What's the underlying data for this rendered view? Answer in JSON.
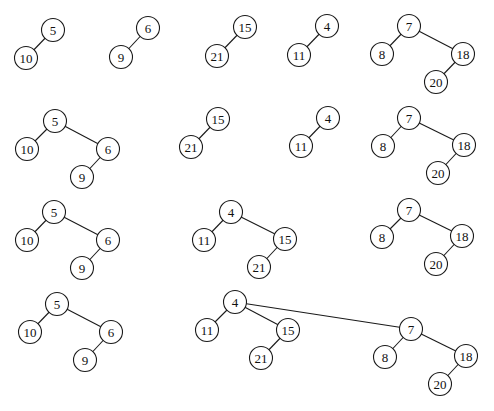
{
  "diagram": {
    "type": "binomial-heap-union-steps",
    "node_radius": 11.5,
    "colors": {
      "stroke": "#1a1a1a",
      "fill": "#ffffff",
      "text": "#111111",
      "background": "#ffffff"
    },
    "rows": [
      {
        "name": "row-1",
        "trees": [
          {
            "name": "tree-5",
            "nodes": [
              {
                "id": "a5",
                "label": "5",
                "x": 53,
                "y": 30
              },
              {
                "id": "a10",
                "label": "10",
                "x": 26,
                "y": 58
              }
            ],
            "edges": [
              [
                "a5",
                "a10"
              ]
            ]
          },
          {
            "name": "tree-6",
            "nodes": [
              {
                "id": "a6",
                "label": "6",
                "x": 148,
                "y": 28
              },
              {
                "id": "a9",
                "label": "9",
                "x": 121,
                "y": 57
              }
            ],
            "edges": [
              [
                "a6",
                "a9"
              ]
            ]
          },
          {
            "name": "tree-15",
            "nodes": [
              {
                "id": "a15",
                "label": "15",
                "x": 245,
                "y": 27
              },
              {
                "id": "a21",
                "label": "21",
                "x": 217,
                "y": 56
              }
            ],
            "edges": [
              [
                "a15",
                "a21"
              ]
            ]
          },
          {
            "name": "tree-4",
            "nodes": [
              {
                "id": "a4",
                "label": "4",
                "x": 327,
                "y": 26
              },
              {
                "id": "a11",
                "label": "11",
                "x": 299,
                "y": 55
              }
            ],
            "edges": [
              [
                "a4",
                "a11"
              ]
            ]
          },
          {
            "name": "tree-7",
            "nodes": [
              {
                "id": "a7",
                "label": "7",
                "x": 409,
                "y": 26
              },
              {
                "id": "a8",
                "label": "8",
                "x": 382,
                "y": 54
              },
              {
                "id": "a18",
                "label": "18",
                "x": 463,
                "y": 54
              },
              {
                "id": "a20",
                "label": "20",
                "x": 436,
                "y": 82
              }
            ],
            "edges": [
              [
                "a7",
                "a8"
              ],
              [
                "a7",
                "a18"
              ],
              [
                "a18",
                "a20"
              ]
            ]
          }
        ]
      },
      {
        "name": "row-2",
        "trees": [
          {
            "name": "tree-5",
            "nodes": [
              {
                "id": "b5",
                "label": "5",
                "x": 55,
                "y": 121
              },
              {
                "id": "b10",
                "label": "10",
                "x": 27,
                "y": 149
              },
              {
                "id": "b6",
                "label": "6",
                "x": 108,
                "y": 149
              },
              {
                "id": "b9",
                "label": "9",
                "x": 82,
                "y": 177
              }
            ],
            "edges": [
              [
                "b5",
                "b10"
              ],
              [
                "b5",
                "b6"
              ],
              [
                "b6",
                "b9"
              ]
            ]
          },
          {
            "name": "tree-15",
            "nodes": [
              {
                "id": "b15",
                "label": "15",
                "x": 218,
                "y": 119
              },
              {
                "id": "b21",
                "label": "21",
                "x": 191,
                "y": 147
              }
            ],
            "edges": [
              [
                "b15",
                "b21"
              ]
            ]
          },
          {
            "name": "tree-4",
            "nodes": [
              {
                "id": "b4",
                "label": "4",
                "x": 328,
                "y": 118
              },
              {
                "id": "b11",
                "label": "11",
                "x": 301,
                "y": 146
              }
            ],
            "edges": [
              [
                "b4",
                "b11"
              ]
            ]
          },
          {
            "name": "tree-7",
            "nodes": [
              {
                "id": "b7",
                "label": "7",
                "x": 409,
                "y": 118
              },
              {
                "id": "b8",
                "label": "8",
                "x": 383,
                "y": 146
              },
              {
                "id": "b18",
                "label": "18",
                "x": 464,
                "y": 145
              },
              {
                "id": "b20",
                "label": "20",
                "x": 438,
                "y": 173
              }
            ],
            "edges": [
              [
                "b7",
                "b8"
              ],
              [
                "b7",
                "b18"
              ],
              [
                "b18",
                "b20"
              ]
            ]
          }
        ]
      },
      {
        "name": "row-3",
        "trees": [
          {
            "name": "tree-5",
            "nodes": [
              {
                "id": "c5",
                "label": "5",
                "x": 54,
                "y": 212
              },
              {
                "id": "c10",
                "label": "10",
                "x": 27,
                "y": 240
              },
              {
                "id": "c6",
                "label": "6",
                "x": 108,
                "y": 240
              },
              {
                "id": "c9",
                "label": "9",
                "x": 82,
                "y": 268
              }
            ],
            "edges": [
              [
                "c5",
                "c10"
              ],
              [
                "c5",
                "c6"
              ],
              [
                "c6",
                "c9"
              ]
            ]
          },
          {
            "name": "tree-4",
            "nodes": [
              {
                "id": "c4",
                "label": "4",
                "x": 231,
                "y": 212
              },
              {
                "id": "c11",
                "label": "11",
                "x": 204,
                "y": 240
              },
              {
                "id": "c15",
                "label": "15",
                "x": 285,
                "y": 239
              },
              {
                "id": "c21",
                "label": "21",
                "x": 259,
                "y": 267
              }
            ],
            "edges": [
              [
                "c4",
                "c11"
              ],
              [
                "c4",
                "c15"
              ],
              [
                "c15",
                "c21"
              ]
            ]
          },
          {
            "name": "tree-7",
            "nodes": [
              {
                "id": "c7",
                "label": "7",
                "x": 409,
                "y": 210
              },
              {
                "id": "c8",
                "label": "8",
                "x": 382,
                "y": 237
              },
              {
                "id": "c18",
                "label": "18",
                "x": 462,
                "y": 236
              },
              {
                "id": "c20",
                "label": "20",
                "x": 436,
                "y": 264
              }
            ],
            "edges": [
              [
                "c7",
                "c8"
              ],
              [
                "c7",
                "c18"
              ],
              [
                "c18",
                "c20"
              ]
            ]
          }
        ]
      },
      {
        "name": "row-4",
        "trees": [
          {
            "name": "tree-5",
            "nodes": [
              {
                "id": "d5",
                "label": "5",
                "x": 57,
                "y": 304
              },
              {
                "id": "d10",
                "label": "10",
                "x": 30,
                "y": 332
              },
              {
                "id": "d6",
                "label": "6",
                "x": 111,
                "y": 332
              },
              {
                "id": "d9",
                "label": "9",
                "x": 85,
                "y": 360
              }
            ],
            "edges": [
              [
                "d5",
                "d10"
              ],
              [
                "d5",
                "d6"
              ],
              [
                "d6",
                "d9"
              ]
            ]
          },
          {
            "name": "tree-4",
            "nodes": [
              {
                "id": "d4",
                "label": "4",
                "x": 235,
                "y": 302
              },
              {
                "id": "d11",
                "label": "11",
                "x": 207,
                "y": 330
              },
              {
                "id": "d15",
                "label": "15",
                "x": 288,
                "y": 330
              },
              {
                "id": "d21",
                "label": "21",
                "x": 261,
                "y": 358
              },
              {
                "id": "d7",
                "label": "7",
                "x": 411,
                "y": 329
              },
              {
                "id": "d8",
                "label": "8",
                "x": 385,
                "y": 357
              },
              {
                "id": "d18",
                "label": "18",
                "x": 466,
                "y": 356
              },
              {
                "id": "d20",
                "label": "20",
                "x": 440,
                "y": 384
              }
            ],
            "edges": [
              [
                "d4",
                "d11"
              ],
              [
                "d4",
                "d15"
              ],
              [
                "d15",
                "d21"
              ],
              [
                "d4",
                "d7"
              ],
              [
                "d7",
                "d8"
              ],
              [
                "d7",
                "d18"
              ],
              [
                "d18",
                "d20"
              ]
            ]
          }
        ]
      }
    ]
  }
}
